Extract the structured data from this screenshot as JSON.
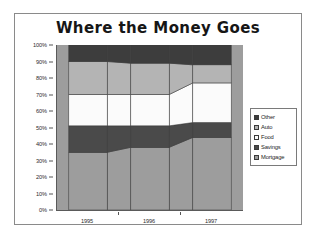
{
  "chart_data": {
    "type": "area",
    "title": "Where the Money Goes",
    "xlabel": "",
    "ylabel": "",
    "categories": [
      "1995",
      "1996",
      "1997"
    ],
    "ylim": [
      0,
      100
    ],
    "y_ticks": [
      "0%",
      "10%",
      "20%",
      "30%",
      "40%",
      "50%",
      "60%",
      "70%",
      "80%",
      "90%",
      "100%"
    ],
    "y_tick_values": [
      0,
      10,
      20,
      30,
      40,
      50,
      60,
      70,
      80,
      90,
      100
    ],
    "grid": false,
    "legend_position": "right",
    "stack_order_bottom_to_top": [
      "Mortgage",
      "Savings",
      "Food",
      "Auto",
      "Other"
    ],
    "series": [
      {
        "name": "Other",
        "values": [
          10,
          11,
          12
        ],
        "color": "#3d3d3d"
      },
      {
        "name": "Auto",
        "values": [
          20,
          19,
          11
        ],
        "color": "#b4b4b4"
      },
      {
        "name": "Food",
        "values": [
          19,
          19,
          24
        ],
        "color": "#fbfbfb"
      },
      {
        "name": "Savings",
        "values": [
          16,
          13,
          9
        ],
        "color": "#4a4a4a"
      },
      {
        "name": "Mortgage",
        "values": [
          35,
          38,
          44
        ],
        "color": "#9d9d9d"
      }
    ],
    "cumulative_tops": {
      "Mortgage": [
        35,
        38,
        44
      ],
      "Savings": [
        51,
        51,
        53
      ],
      "Food": [
        70,
        70,
        77
      ],
      "Auto": [
        90,
        89,
        88
      ],
      "Other": [
        100,
        100,
        100
      ]
    }
  },
  "legend": {
    "items": [
      {
        "label": "Other",
        "color": "#3d3d3d"
      },
      {
        "label": "Auto",
        "color": "#b4b4b4"
      },
      {
        "label": "Food",
        "color": "#fbfbfb"
      },
      {
        "label": "Savings",
        "color": "#4a4a4a"
      },
      {
        "label": "Mortgage",
        "color": "#9d9d9d"
      }
    ]
  },
  "colors": {
    "frame_border": "#8a8a8a",
    "plot_border": "#5a5a5a",
    "segment_outline": "#3c3c3c",
    "background": "#ffffff",
    "text": "#1c1c1c"
  }
}
